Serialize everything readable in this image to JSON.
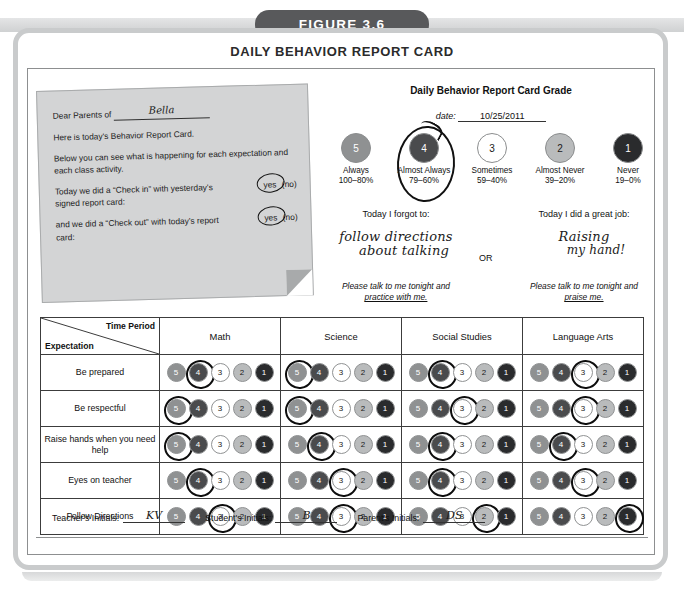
{
  "figure": {
    "badge": "FIGURE 3.6",
    "title": "DAILY BEHAVIOR REPORT CARD"
  },
  "note": {
    "salutation": "Dear Parents of",
    "student_name": "Bella",
    "line1": "Here is today's Behavior Report Card.",
    "line2": "Below you can see what is happening for each expectation and each class activity.",
    "q1": "Today we did a “Check in” with yesterday's signed report card:",
    "q1_yes": "yes",
    "q1_no": "(no)",
    "q1_selected": "yes",
    "q2": "and we did a “Check out” with today's report card:",
    "q2_yes": "yes",
    "q2_no": "(no)",
    "q2_selected": "yes"
  },
  "grade": {
    "heading": "Daily Behavior Report Card Grade",
    "date_label": "date:",
    "date_value": "10/25/2011",
    "selected_score": 4,
    "scale": [
      {
        "score": "5",
        "label": "Always",
        "pct": "100–80%",
        "fill": "#8f9192",
        "text": "#ffffff"
      },
      {
        "score": "4",
        "label": "Almost Always",
        "pct": "79–60%",
        "fill": "#4a4b4d",
        "text": "#ffffff"
      },
      {
        "score": "3",
        "label": "Sometimes",
        "pct": "59–40%",
        "fill": "#ffffff",
        "text": "#1a1a1a"
      },
      {
        "score": "2",
        "label": "Almost Never",
        "pct": "39–20%",
        "fill": "#b9bbbc",
        "text": "#1a1a1a"
      },
      {
        "score": "1",
        "label": "Never",
        "pct": "19–0%",
        "fill": "#2a2b2d",
        "text": "#ffffff"
      }
    ]
  },
  "today": {
    "forgot_heading": "Today I forgot to:",
    "forgot_hand_line1": "follow directions",
    "forgot_hand_line2": "about talking",
    "or": "OR",
    "great_heading": "Today I did a great job:",
    "great_hand_line1": "Raising",
    "great_hand_line2": "my hand!",
    "forgot_footer_a": "Please talk to me tonight and",
    "forgot_footer_b": "practice with me.",
    "great_footer_a": "Please talk to me tonight and",
    "great_footer_b": "praise me."
  },
  "table": {
    "corner_top": "Time Period",
    "corner_bottom": "Expectation",
    "columns": [
      "Math",
      "Science",
      "Social Studies",
      "Language Arts"
    ],
    "scores": [
      "5",
      "4",
      "3",
      "2",
      "1"
    ],
    "rows": [
      {
        "label": "Be prepared",
        "marks": [
          4,
          5,
          4,
          3
        ]
      },
      {
        "label": "Be respectful",
        "marks": [
          5,
          5,
          3,
          3
        ]
      },
      {
        "label": "Raise hands when you need help",
        "marks": [
          5,
          4,
          4,
          4
        ]
      },
      {
        "label": "Eyes on teacher",
        "marks": [
          4,
          3,
          4,
          3
        ]
      },
      {
        "label": "Follow Directions",
        "marks": [
          3,
          3,
          2,
          1
        ]
      }
    ]
  },
  "initials": [
    {
      "label": "Teacher's Initials:",
      "value": "KV"
    },
    {
      "label": "Student's Initials:",
      "value": "B"
    },
    {
      "label": "Parent's Initials:",
      "value": "DS"
    }
  ],
  "chart_data": {
    "type": "table",
    "title": "Daily Behavior Report Card",
    "categories": [
      "Math",
      "Science",
      "Social Studies",
      "Language Arts"
    ],
    "series": [
      {
        "name": "Be prepared",
        "values": [
          4,
          5,
          4,
          3
        ]
      },
      {
        "name": "Be respectful",
        "values": [
          5,
          5,
          3,
          3
        ]
      },
      {
        "name": "Raise hands when you need help",
        "values": [
          5,
          4,
          4,
          4
        ]
      },
      {
        "name": "Eyes on teacher",
        "values": [
          4,
          3,
          4,
          3
        ]
      },
      {
        "name": "Follow Directions",
        "values": [
          3,
          3,
          2,
          1
        ]
      }
    ],
    "ylabel": "Rating (1-5)",
    "ylim": [
      1,
      5
    ],
    "overall_grade": 4
  }
}
